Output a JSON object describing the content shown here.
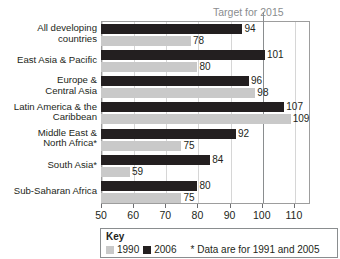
{
  "chart_data": {
    "type": "bar",
    "orientation": "horizontal",
    "title": "",
    "xlabel": "",
    "ylabel": "",
    "xlim": [
      50,
      115
    ],
    "xticks": [
      50,
      60,
      70,
      80,
      90,
      100,
      110
    ],
    "grid": true,
    "categories": [
      "All developing countries",
      "East Asia & Pacific",
      "Europe & Central Asia",
      "Latin America & the Caribbean",
      "Middle East & North Africa*",
      "South Asia*",
      "Sub-Saharan Africa"
    ],
    "series": [
      {
        "name": "2006",
        "color": "#231f20",
        "values": [
          94,
          101,
          96,
          107,
          92,
          84,
          80
        ]
      },
      {
        "name": "1990",
        "color": "#c9c9c9",
        "values": [
          78,
          80,
          98,
          109,
          75,
          59,
          75
        ]
      }
    ],
    "annotations": [
      {
        "name": "target-line",
        "text": "Target for 2015",
        "x": 100,
        "color": "#8a8d8f"
      }
    ],
    "legend": {
      "title": "Key",
      "position": "bottom",
      "entries": [
        {
          "label": "1990",
          "color": "#c9c9c9"
        },
        {
          "label": "2006",
          "color": "#231f20"
        }
      ],
      "note": "* Data are for 1991 and 2005"
    }
  },
  "axis": {
    "tick_labels": [
      "50",
      "60",
      "70",
      "80",
      "90",
      "100",
      "110"
    ]
  },
  "values_2006": [
    "94",
    "101",
    "96",
    "107",
    "92",
    "84",
    "80"
  ],
  "values_1990": [
    "78",
    "80",
    "98",
    "109",
    "75",
    "59",
    "75"
  ],
  "categories_display": [
    [
      "All developing",
      "countries"
    ],
    [
      "East Asia & Pacific"
    ],
    [
      "Europe &",
      "Central Asia"
    ],
    [
      "Latin America & the",
      "Caribbean"
    ],
    [
      "Middle East &",
      "North Africa*"
    ],
    [
      "South Asia*"
    ],
    [
      "Sub-Saharan Africa"
    ]
  ]
}
